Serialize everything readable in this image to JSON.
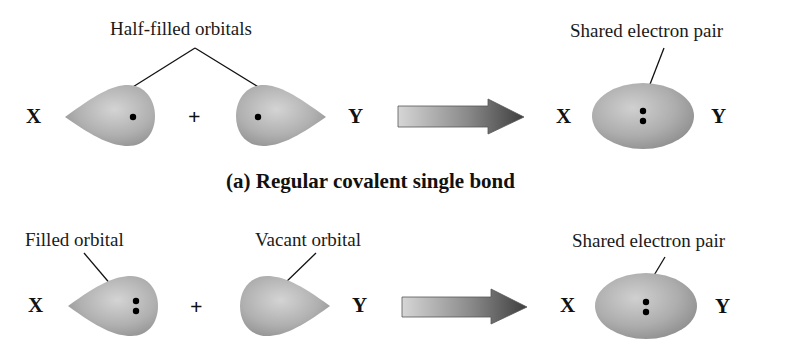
{
  "figure": {
    "panel_a": {
      "caption": "(a) Regular covalent single bond",
      "reactant_label": "Half-filled orbitals",
      "product_label": "Shared electron pair",
      "left_atom": "X",
      "right_atom": "Y",
      "operator": "+",
      "product_left_atom": "X",
      "product_right_atom": "Y",
      "left_orbital_electrons": 1,
      "right_orbital_electrons": 1,
      "product_electrons": 2
    },
    "panel_b": {
      "left_label": "Filled orbital",
      "right_label": "Vacant orbital",
      "product_label": "Shared electron pair",
      "left_atom": "X",
      "right_atom": "Y",
      "operator": "+",
      "product_left_atom": "X",
      "product_right_atom": "Y",
      "left_orbital_electrons": 2,
      "right_orbital_electrons": 0,
      "product_electrons": 2
    },
    "colors": {
      "orbital_fill": "#a9a9a9",
      "orbital_highlight": "#cfcfcf",
      "arrow_light": "#d8d8d8",
      "arrow_dark": "#404040",
      "line": "#111111"
    }
  }
}
